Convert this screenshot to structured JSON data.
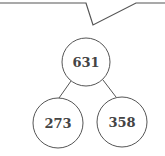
{
  "diagram": {
    "type": "number-bond",
    "root": {
      "value": "631"
    },
    "children": [
      {
        "value": "273"
      },
      {
        "value": "358"
      }
    ]
  },
  "colors": {
    "stroke": "#555555",
    "text": "#444444",
    "background": "#ffffff"
  }
}
